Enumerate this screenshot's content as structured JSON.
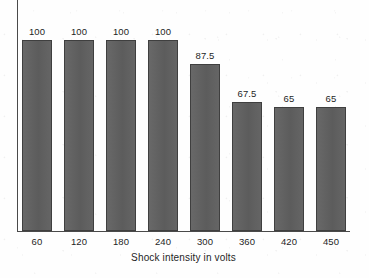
{
  "chart_data": {
    "type": "bar",
    "title": "",
    "subtitle": "",
    "xlabel": "Shock intensity in volts",
    "ylabel": "",
    "categories": [
      "60",
      "120",
      "180",
      "240",
      "300",
      "360",
      "420",
      "450"
    ],
    "values": [
      100,
      100,
      100,
      100,
      87.5,
      67.5,
      65,
      65
    ],
    "value_labels": [
      "100",
      "100",
      "100",
      "100",
      "87.5",
      "67.5",
      "65",
      "65"
    ],
    "ylim": [
      0,
      100
    ],
    "xlim_note": "categorical",
    "grid": false,
    "legend": false,
    "legend_position": "none",
    "y_tick_labels": [],
    "annotations": [],
    "series": [
      {
        "name": "Percent obedience",
        "values": [
          100,
          100,
          100,
          100,
          87.5,
          67.5,
          65,
          65
        ]
      }
    ],
    "colors": {
      "bar_fill": "#606060",
      "bar_border": "#3f3f3f",
      "axis": "#4a4a4a",
      "text": "#1f1f1f",
      "background": "#fefefe"
    }
  }
}
